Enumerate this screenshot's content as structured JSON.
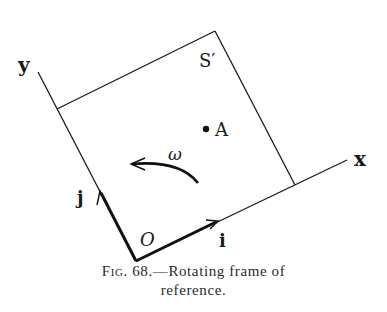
{
  "figure": {
    "labels": {
      "y_axis": "y",
      "x_axis": "x",
      "frame": "S′",
      "point": "A",
      "angular_velocity": "ω",
      "unit_j": "j",
      "unit_i": "i",
      "origin": "O"
    },
    "caption": {
      "prefix": "Fig.",
      "number": "68.",
      "text": "—Rotating frame of",
      "line2": "reference."
    },
    "colors": {
      "ink": "#1a1a1a",
      "background": "#ffffff"
    }
  }
}
